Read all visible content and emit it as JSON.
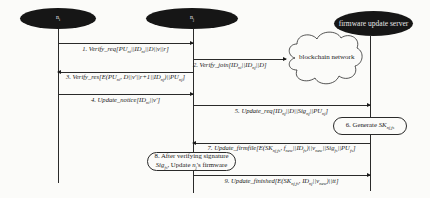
{
  "diagram": {
    "type": "sequence-diagram",
    "participants": [
      {
        "id": "ni",
        "label": "n_i"
      },
      {
        "id": "nj",
        "label": "n_j"
      },
      {
        "id": "server",
        "label": "firmware update server"
      }
    ],
    "cloud": {
      "label": "blockchain network"
    },
    "messages": [
      {
        "step": 1,
        "from": "ni",
        "to": "nj",
        "label": "1. Verify_req[PU_ni||ID_ni||D||v||r]"
      },
      {
        "step": 2,
        "from": "nj",
        "to": "blockchain",
        "label": "2. Verify_join[ID_ni||ID_nj||D]"
      },
      {
        "step": 3,
        "from": "nj",
        "to": "ni",
        "label": "3. Verify_res[E(PU_ni, D||v'||r+1||ID_nj)||PU_nj]"
      },
      {
        "step": 4,
        "from": "ni",
        "to": "nj",
        "label": "4. Update_notice[ID_ni||v']"
      },
      {
        "step": 5,
        "from": "nj",
        "to": "server",
        "label": "5. Update_req[ID_nj||D||Sig_nj||PU_nj]"
      },
      {
        "step": 7,
        "from": "server",
        "to": "nj",
        "label": "7. Update_firmfile[E(SK_nj,fs, f_new||ID_fs)||v_new||Sig_fs||PU_fs]"
      },
      {
        "step": 9,
        "from": "nj",
        "to": "server",
        "label": "9. Update_finished[E(SK_nj,fs, ID_nj||v_new)||tt]"
      }
    ],
    "actions": [
      {
        "step": 6,
        "at": "server",
        "label": "6. Generate SK_nj,fs"
      },
      {
        "step": 8,
        "at": "nj",
        "label_line1": "8. After verifying signature",
        "label_line2": "Sig_fs, Update n_j's firmware"
      }
    ]
  }
}
